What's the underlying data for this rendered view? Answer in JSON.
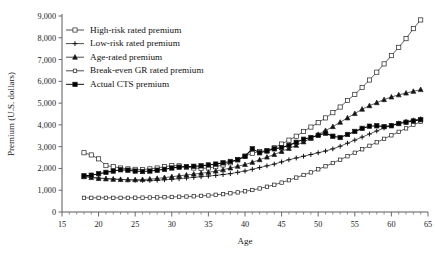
{
  "chart_data": {
    "type": "line",
    "title": "",
    "xlabel": "Age",
    "ylabel": "Premium (U.S. dollars)",
    "xlim": [
      15,
      65
    ],
    "ylim": [
      0,
      9000
    ],
    "xticks": [
      15,
      20,
      25,
      30,
      35,
      40,
      45,
      50,
      55,
      60,
      65
    ],
    "xticklabels": [
      "15",
      "20",
      "25",
      "30",
      "35",
      "40",
      "45",
      "50",
      "55",
      "60",
      "65"
    ],
    "yticks": [
      0,
      1000,
      2000,
      3000,
      4000,
      5000,
      6000,
      7000,
      8000,
      9000
    ],
    "yticklabels": [
      "0",
      "1,000",
      "2,000",
      "3,000",
      "4,000",
      "5,000",
      "6,000",
      "7,000",
      "8,000",
      "9,000"
    ],
    "grid": false,
    "legend_position": "upper-left-inside",
    "x": [
      18,
      19,
      20,
      21,
      22,
      23,
      24,
      25,
      26,
      27,
      28,
      29,
      30,
      31,
      32,
      33,
      34,
      35,
      36,
      37,
      38,
      39,
      40,
      41,
      42,
      43,
      44,
      45,
      46,
      47,
      48,
      49,
      50,
      51,
      52,
      53,
      54,
      55,
      56,
      57,
      58,
      59,
      60,
      61,
      62,
      63,
      64
    ],
    "series": [
      {
        "name": "High-risk rated premium",
        "marker": "open-square",
        "values": [
          2720,
          2620,
          2440,
          2130,
          2080,
          2020,
          1980,
          1960,
          1950,
          1980,
          2020,
          2080,
          2130,
          2120,
          2060,
          2020,
          2000,
          2020,
          2080,
          2160,
          2260,
          2400,
          2560,
          2700,
          2780,
          2820,
          2950,
          3120,
          3300,
          3480,
          3700,
          3900,
          4100,
          4320,
          4560,
          4820,
          5120,
          5400,
          5720,
          6060,
          6420,
          6800,
          7180,
          7560,
          7960,
          8420,
          8820
        ]
      },
      {
        "name": "Low-risk rated premium",
        "marker": "plus",
        "values": [
          1660,
          1600,
          1560,
          1540,
          1520,
          1500,
          1480,
          1460,
          1450,
          1450,
          1460,
          1480,
          1500,
          1530,
          1560,
          1590,
          1620,
          1650,
          1680,
          1720,
          1760,
          1820,
          1880,
          1960,
          2040,
          2120,
          2200,
          2300,
          2400,
          2480,
          2560,
          2640,
          2720,
          2800,
          2900,
          3020,
          3160,
          3300,
          3440,
          3580,
          3720,
          3860,
          3980,
          4080,
          4160,
          4220,
          4280
        ]
      },
      {
        "name": "Age-rated premium",
        "marker": "triangle",
        "values": [
          1620,
          1580,
          1540,
          1520,
          1500,
          1490,
          1480,
          1480,
          1490,
          1510,
          1540,
          1580,
          1620,
          1660,
          1700,
          1740,
          1780,
          1820,
          1880,
          1940,
          2020,
          2100,
          2180,
          2280,
          2400,
          2520,
          2640,
          2780,
          2920,
          3060,
          3220,
          3380,
          3560,
          3740,
          3920,
          4120,
          4320,
          4520,
          4720,
          4880,
          5020,
          5160,
          5280,
          5380,
          5460,
          5540,
          5620
        ]
      },
      {
        "name": "Break-even GR rated premium",
        "marker": "open-square-small",
        "values": [
          650,
          650,
          650,
          650,
          650,
          650,
          650,
          655,
          660,
          665,
          670,
          680,
          690,
          700,
          710,
          720,
          740,
          760,
          790,
          820,
          860,
          900,
          950,
          1010,
          1080,
          1160,
          1250,
          1350,
          1460,
          1580,
          1700,
          1820,
          1960,
          2100,
          2250,
          2400,
          2560,
          2720,
          2880,
          3040,
          3200,
          3360,
          3520,
          3680,
          3840,
          4000,
          4140
        ]
      },
      {
        "name": "Actual CTS premium",
        "marker": "filled-square",
        "values": [
          1660,
          1690,
          1760,
          1820,
          1880,
          1940,
          1920,
          1880,
          1860,
          1880,
          1920,
          1960,
          2020,
          2060,
          2080,
          2100,
          2120,
          2160,
          2200,
          2260,
          2320,
          2400,
          2560,
          2900,
          2720,
          2800,
          2900,
          2960,
          3060,
          3200,
          3340,
          3420,
          3520,
          3620,
          3480,
          3420,
          3560,
          3700,
          3840,
          3940,
          3960,
          3920,
          3960,
          4060,
          4120,
          4180,
          4240
        ]
      }
    ]
  },
  "legend": {
    "items": [
      {
        "label": "High-risk rated premium",
        "marker": "open-square"
      },
      {
        "label": "Low-risk rated premium",
        "marker": "plus"
      },
      {
        "label": "Age-rated premium",
        "marker": "triangle"
      },
      {
        "label": "Break-even GR rated premium",
        "marker": "open-square-small"
      },
      {
        "label": "Actual CTS premium",
        "marker": "filled-square"
      }
    ]
  },
  "colors": {
    "line": "#3a3a3a",
    "bold_line": "#000000",
    "axis": "#5a5a5a",
    "text": "#111111",
    "background": "#ffffff"
  }
}
